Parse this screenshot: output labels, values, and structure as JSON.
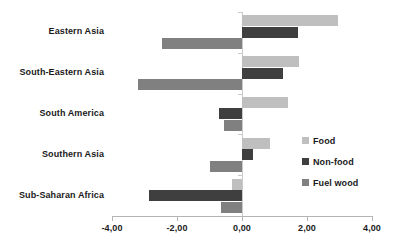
{
  "chart_data": {
    "type": "bar",
    "orientation": "horizontal",
    "title": "",
    "subtitle": "",
    "xlabel": "",
    "ylabel": "",
    "xlim": [
      -4.0,
      4.0
    ],
    "grid": false,
    "legend_position": "right",
    "categories": [
      "Eastern Asia",
      "South-Eastern Asia",
      "South America",
      "Southern Asia",
      "Sub-Saharan Africa"
    ],
    "xticks": [
      -4.0,
      -2.0,
      0.0,
      2.0,
      4.0
    ],
    "xtick_labels": [
      "-4,00",
      "-2,00",
      "0,00",
      "2,00",
      "4,00"
    ],
    "series": [
      {
        "name": "Food",
        "color": "#bfbfbf",
        "values": [
          2.95,
          1.75,
          1.4,
          0.85,
          -0.3
        ]
      },
      {
        "name": "Non-food",
        "color": "#3f3f3f",
        "values": [
          1.72,
          1.25,
          -0.7,
          0.35,
          -2.85
        ]
      },
      {
        "name": "Fuel wood",
        "color": "#808080",
        "values": [
          -2.45,
          -3.2,
          -0.55,
          -1.0,
          -0.65
        ]
      }
    ]
  },
  "legend": {
    "items": [
      {
        "label": "Food",
        "color": "#bfbfbf"
      },
      {
        "label": "Non-food",
        "color": "#3f3f3f"
      },
      {
        "label": "Fuel wood",
        "color": "#808080"
      }
    ]
  },
  "axis": {
    "zero_label": "0,00",
    "line_color": "#b5b5b5"
  }
}
